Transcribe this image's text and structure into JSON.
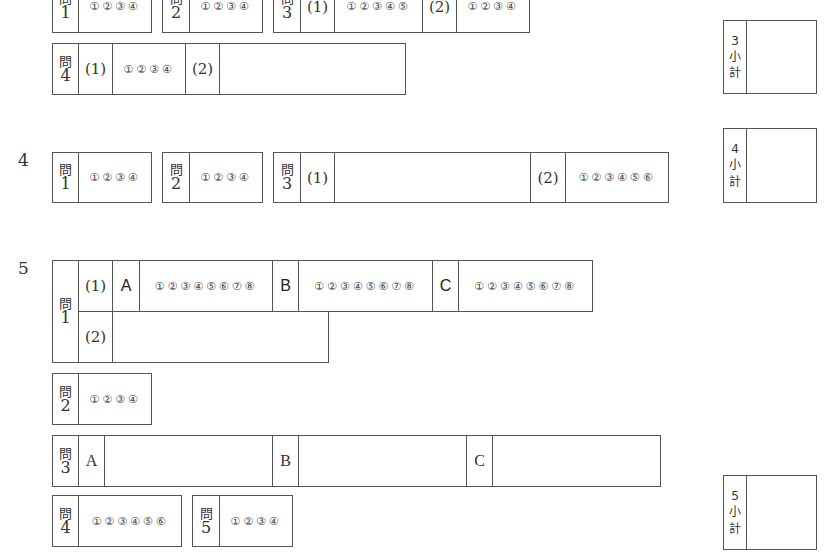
{
  "section3": {
    "q1": {
      "kanji": "問",
      "num": "1",
      "choices": "①②③④"
    },
    "q2": {
      "kanji": "問",
      "num": "2",
      "choices": "①②③④"
    },
    "q3": {
      "kanji": "問",
      "num": "3",
      "p1": "(1)",
      "choices1": "①②③④⑤",
      "p2": "(2)",
      "choices2": "①②③④"
    },
    "q4": {
      "kanji": "問",
      "num": "4",
      "p1": "(1)",
      "choices1": "①②③④",
      "p2": "(2)"
    },
    "subtotal": {
      "num": "3",
      "k1": "小",
      "k2": "計"
    }
  },
  "section4": {
    "label": "4",
    "q1": {
      "kanji": "問",
      "num": "1",
      "choices": "①②③④"
    },
    "q2": {
      "kanji": "問",
      "num": "2",
      "choices": "①②③④"
    },
    "q3": {
      "kanji": "問",
      "num": "3",
      "p1": "(1)",
      "p2": "(2)",
      "choices2": "①②③④⑤⑥"
    },
    "subtotal": {
      "num": "4",
      "k1": "小",
      "k2": "計"
    }
  },
  "section5": {
    "label": "5",
    "q1": {
      "kanji": "問",
      "num": "1",
      "p1": "(1)",
      "a": "A",
      "choicesA": "①②③④⑤⑥⑦⑧",
      "b": "B",
      "choicesB": "①②③④⑤⑥⑦⑧",
      "c": "C",
      "choicesC": "①②③④⑤⑥⑦⑧",
      "p2": "(2)"
    },
    "q2": {
      "kanji": "問",
      "num": "2",
      "choices": "①②③④"
    },
    "q3": {
      "kanji": "問",
      "num": "3",
      "a": "A",
      "b": "B",
      "c": "C"
    },
    "q4": {
      "kanji": "問",
      "num": "4",
      "choices": "①②③④⑤⑥"
    },
    "q5": {
      "kanji": "問",
      "num": "5",
      "choices": "①②③④"
    },
    "subtotal": {
      "num": "5",
      "k1": "小",
      "k2": "計"
    }
  }
}
